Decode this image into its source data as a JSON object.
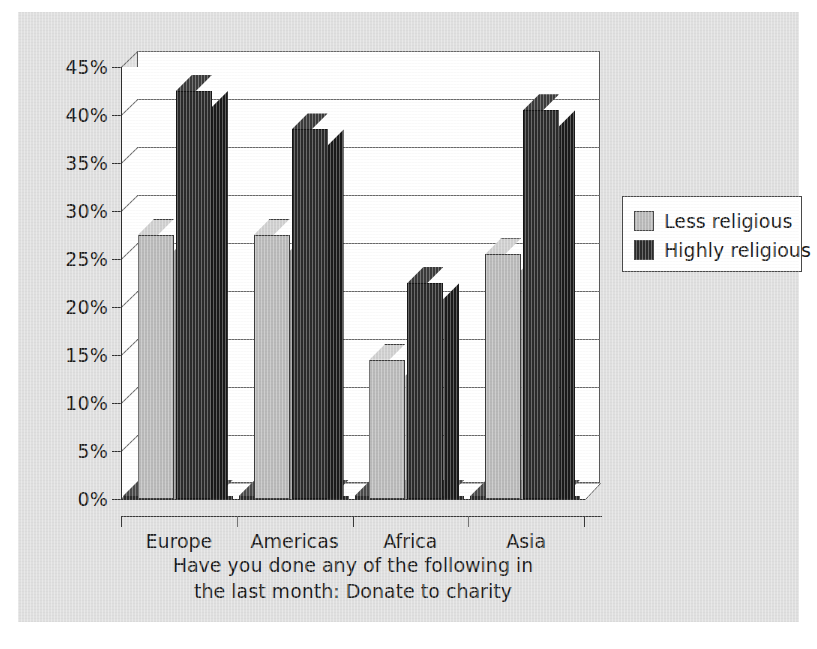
{
  "chart_data": {
    "type": "bar",
    "title": "Have you done any of the following in the last month:  Donate to charity",
    "title_line1": "Have you done any of the following in",
    "title_line2": "the last month:  Donate to charity",
    "xlabel": "",
    "ylabel": "",
    "categories": [
      "Europe",
      "Americas",
      "Africa",
      "Asia"
    ],
    "series": [
      {
        "name": "Less religious",
        "values": [
          27.5,
          27.5,
          14.5,
          25.5
        ],
        "color": "#b9b9b9"
      },
      {
        "name": "Highly religious",
        "values": [
          42.5,
          38.5,
          22.5,
          40.5
        ],
        "color": "#2b2b2b"
      }
    ],
    "ylim": [
      0,
      45
    ],
    "ytick_values": [
      0,
      5,
      10,
      15,
      20,
      25,
      30,
      35,
      40,
      45
    ],
    "ytick_labels": [
      "0%",
      "5%",
      "10%",
      "15%",
      "20%",
      "25%",
      "30%",
      "35%",
      "40%",
      "45%"
    ],
    "grid": true,
    "legend_position": "right",
    "style": "3d-column"
  },
  "legend": {
    "items": [
      {
        "label": "Less religious",
        "swatch": "#b9b9b9"
      },
      {
        "label": "Highly religious",
        "swatch": "#2b2b2b"
      }
    ]
  },
  "caption": ""
}
